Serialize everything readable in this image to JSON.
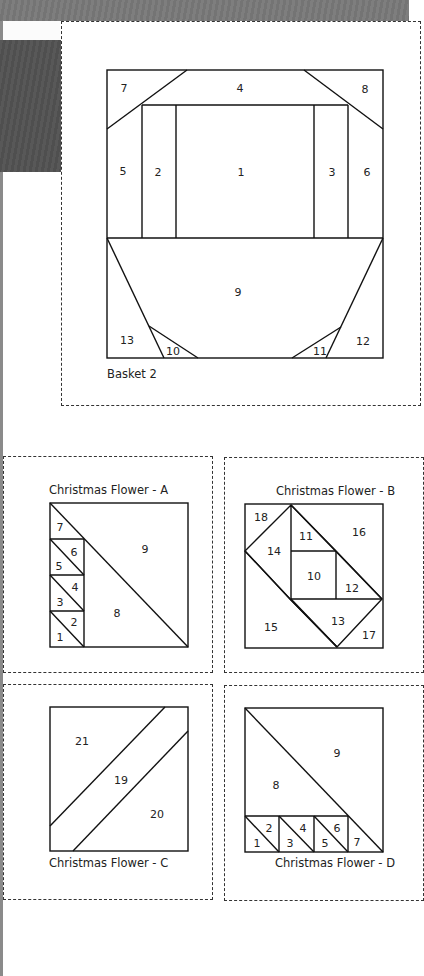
{
  "page": {
    "background": {
      "top_band": "#7a7a7a",
      "dark_block": "#555555",
      "paper": "#ffffff"
    }
  },
  "basket": {
    "caption": "Basket 2",
    "pieces": [
      "1",
      "2",
      "3",
      "4",
      "5",
      "6",
      "7",
      "8",
      "9",
      "10",
      "11",
      "12",
      "13"
    ]
  },
  "flower_a": {
    "caption": "Christmas Flower - A",
    "pieces": [
      "1",
      "2",
      "3",
      "4",
      "5",
      "6",
      "7",
      "8",
      "9"
    ]
  },
  "flower_b": {
    "caption": "Christmas Flower - B",
    "pieces": [
      "10",
      "11",
      "12",
      "13",
      "14",
      "15",
      "16",
      "17",
      "18"
    ]
  },
  "flower_c": {
    "caption": "Christmas Flower - C",
    "pieces": [
      "19",
      "20",
      "21"
    ]
  },
  "flower_d": {
    "caption": "Christmas Flower - D",
    "pieces": [
      "1",
      "2",
      "3",
      "4",
      "5",
      "6",
      "7",
      "8",
      "9"
    ]
  }
}
